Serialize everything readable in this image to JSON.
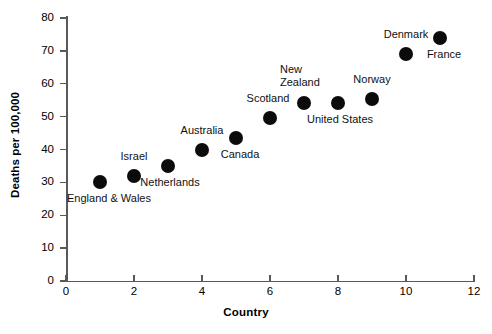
{
  "chart_data": {
    "type": "scatter",
    "title": "",
    "xlabel": "Country",
    "ylabel": "Deaths per 100,000",
    "xlim": [
      0,
      12
    ],
    "ylim": [
      0,
      80
    ],
    "xticks": [
      0,
      2,
      4,
      6,
      8,
      10,
      12
    ],
    "yticks": [
      0,
      10,
      20,
      30,
      40,
      50,
      60,
      70,
      80
    ],
    "grid": false,
    "legend": false,
    "marker_color": "#0b0b0b",
    "axis_color": "#555a5d",
    "x": [
      1,
      2,
      3,
      4,
      5,
      6,
      7,
      8,
      9,
      10,
      11
    ],
    "y": [
      30,
      32,
      35,
      40,
      43.5,
      49.5,
      54,
      54,
      55.5,
      69,
      74
    ],
    "point_labels": [
      "England & Wales",
      "Israel",
      "Netherlands",
      "Australia",
      "Canada",
      "Scotland",
      "New Zealand",
      "United States",
      "Norway",
      "Denmark",
      "France"
    ],
    "points": [
      {
        "label": "England & Wales",
        "x": 1,
        "y": 30
      },
      {
        "label": "Israel",
        "x": 2,
        "y": 32
      },
      {
        "label": "Netherlands",
        "x": 3,
        "y": 35
      },
      {
        "label": "Australia",
        "x": 4,
        "y": 40
      },
      {
        "label": "Canada",
        "x": 5,
        "y": 43.5
      },
      {
        "label": "Scotland",
        "x": 6,
        "y": 49.5
      },
      {
        "label": "New Zealand",
        "x": 7,
        "y": 54
      },
      {
        "label": "United States",
        "x": 8,
        "y": 54
      },
      {
        "label": "Norway",
        "x": 9,
        "y": 55.5
      },
      {
        "label": "Denmark",
        "x": 10,
        "y": 69
      },
      {
        "label": "France",
        "x": 11,
        "y": 74
      }
    ]
  },
  "axis": {
    "y_title": "Deaths per 100,000",
    "x_title": "Country",
    "y_tick_labels": [
      "0",
      "10",
      "20",
      "30",
      "40",
      "50",
      "60",
      "70",
      "80"
    ],
    "x_tick_labels": [
      "0",
      "2",
      "4",
      "6",
      "8",
      "10",
      "12"
    ]
  },
  "labels": {
    "england_wales": "England & Wales",
    "israel": "Israel",
    "netherlands": "Netherlands",
    "australia": "Australia",
    "canada": "Canada",
    "scotland": "Scotland",
    "new_zealand": "New\nZealand",
    "united_states": "United States",
    "norway": "Norway",
    "denmark": "Denmark",
    "france": "France"
  }
}
